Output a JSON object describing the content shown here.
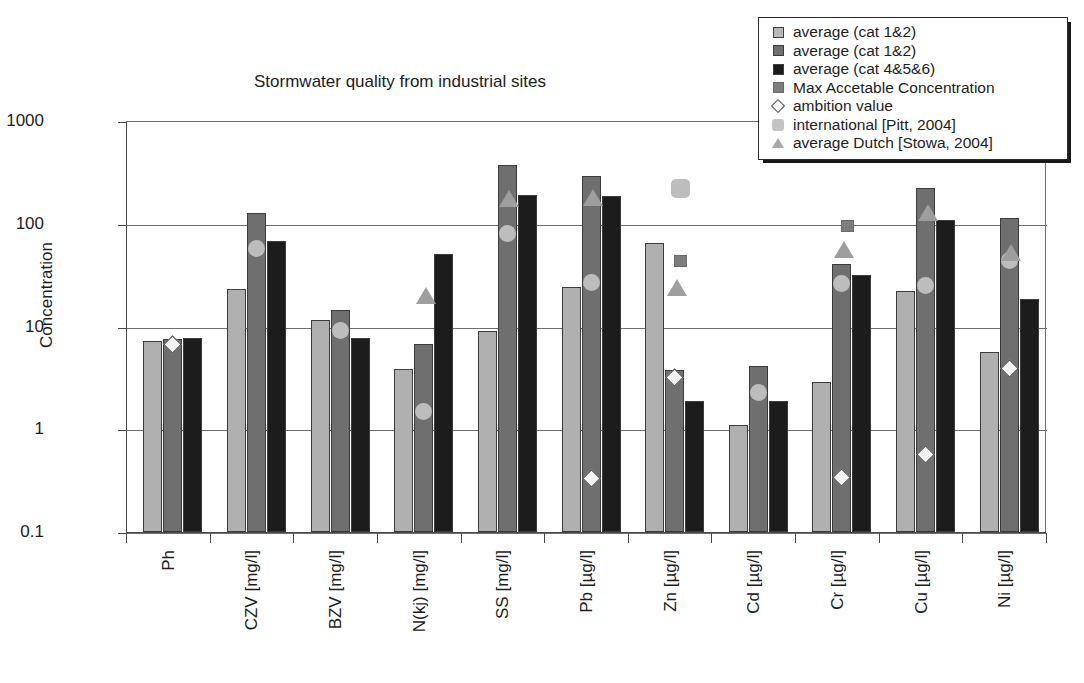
{
  "chart": {
    "title": "Stormwater quality from industrial sites",
    "ylabel": "Concentration",
    "xlabel": ""
  },
  "legend": {
    "position": "top-right",
    "items": [
      {
        "label": "average (cat 1&2)",
        "marker": "square",
        "swatch_class": "sw-box s0",
        "icon": "light-gray-square-icon"
      },
      {
        "label": "average (cat 1&2)",
        "marker": "square",
        "swatch_class": "sw-box s1",
        "icon": "dark-gray-square-icon"
      },
      {
        "label": "average (cat 4&5&6)",
        "marker": "square",
        "swatch_class": "sw-box s2",
        "icon": "black-square-icon"
      },
      {
        "label": "Max Accetable Concentration",
        "marker": "square",
        "swatch_class": "sw-box mac",
        "icon": "medium-gray-square-icon"
      },
      {
        "label": "ambition value",
        "marker": "diamond",
        "swatch_class": "sw-diamond",
        "icon": "open-diamond-icon"
      },
      {
        "label": "international [Pitt, 2004]",
        "marker": "rounded-square",
        "swatch_class": "sw-round",
        "icon": "rounded-square-icon"
      },
      {
        "label": "average Dutch [Stowa, 2004]",
        "marker": "triangle",
        "swatch_class": "sw-tri",
        "icon": "triangle-icon"
      }
    ]
  },
  "yaxis": {
    "ticks": [
      "1000",
      "100",
      "10",
      "1",
      "0.1"
    ],
    "scale": "log",
    "min": 0.1,
    "max": 1000
  },
  "colors": {
    "series_cat12_light": "#b0b0b0",
    "series_cat12_dark": "#6f6f6f",
    "series_cat456": "#1c1c1c",
    "mac_marker": "#7d7d7d",
    "ambition_marker": "#f2f2f2",
    "international_marker": "#bdbdbd",
    "dutch_marker": "#9e9e9e",
    "axis": "#4a4a4a",
    "grid": "#6e6e6e"
  },
  "chart_data": {
    "type": "bar",
    "title": "Stormwater quality from industrial sites",
    "xlabel": "",
    "ylabel": "Concentration",
    "yscale": "log",
    "ylim": [
      0.1,
      1000
    ],
    "yticks": [
      0.1,
      1,
      10,
      100,
      1000
    ],
    "grid": true,
    "legend_position": "top-right",
    "categories": [
      "Ph",
      "CZV [mg/l]",
      "BZV [mg/l]",
      "N(kj) [mg/l]",
      "SS [mg/l]",
      "Pb [µg/l]",
      "Zn [µg/l]",
      "Cd [µg/l]",
      "Cr [µg/l]",
      "Cu [µg/l]",
      "Ni [µg/l]"
    ],
    "series": [
      {
        "name": "average (cat 1&2)",
        "type": "bar",
        "color": "#b0b0b0",
        "values": [
          7.2,
          23,
          11.5,
          3.9,
          9.1,
          24,
          65,
          1.1,
          2.9,
          22,
          5.6
        ]
      },
      {
        "name": "average (cat 1&2)",
        "type": "bar",
        "color": "#6f6f6f",
        "values": [
          7.5,
          126,
          14.5,
          6.8,
          370,
          290,
          3.8,
          4.1,
          41,
          225,
          115
        ]
      },
      {
        "name": "average (cat 4&5&6)",
        "type": "bar",
        "color": "#1c1c1c",
        "values": [
          7.8,
          68,
          7.8,
          51,
          190,
          185,
          1.9,
          1.9,
          32,
          108,
          18.5
        ]
      },
      {
        "name": "Max Accetable Concentration",
        "type": "marker",
        "marker": "square",
        "color": "#7d7d7d",
        "values": [
          null,
          null,
          null,
          null,
          null,
          null,
          43,
          null,
          95,
          null,
          null
        ]
      },
      {
        "name": "ambition value",
        "type": "marker",
        "marker": "diamond",
        "color": "#f2f2f2",
        "values": [
          6.7,
          null,
          null,
          null,
          null,
          0.33,
          3.2,
          null,
          0.34,
          0.57,
          3.9
        ]
      },
      {
        "name": "international [Pitt, 2004]",
        "type": "marker",
        "marker": "rounded-square",
        "color": "#bdbdbd",
        "values": [
          null,
          58,
          9.2,
          1.5,
          80,
          27,
          220,
          2.3,
          26,
          25,
          44
        ]
      },
      {
        "name": "average Dutch [Stowa, 2004]",
        "type": "marker",
        "marker": "triangle",
        "color": "#9e9e9e",
        "values": [
          null,
          null,
          null,
          20,
          175,
          180,
          24,
          null,
          56,
          130,
          52
        ]
      }
    ]
  },
  "caption": ""
}
